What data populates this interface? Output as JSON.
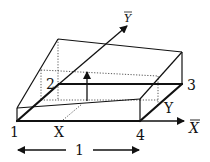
{
  "diagram": {
    "labels": {
      "corner_1": "1",
      "corner_2": "2",
      "corner_3": "3",
      "corner_4": "4",
      "point_x": "X",
      "point_y": "Y",
      "axis_x": "X",
      "axis_y": "Y",
      "width_label": "1"
    },
    "colors": {
      "stroke": "#111111",
      "dotted": "#444444",
      "background": "#ffffff"
    }
  }
}
